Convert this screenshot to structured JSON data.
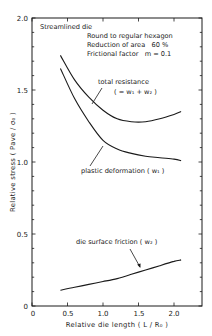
{
  "chart_data": {
    "type": "line",
    "title": "",
    "xlabel": "Relative die length ( L / R₀ )",
    "ylabel": "Relative stress  ( Pave / σ₀ )",
    "xlim": [
      0,
      2.4
    ],
    "ylim": [
      0,
      2.0
    ],
    "x_ticks": [
      "0",
      "0.5",
      "1.0",
      "1.5",
      "2.0"
    ],
    "y_ticks": [
      "0",
      "0.5",
      "1.0",
      "1.5",
      "2.0"
    ],
    "grid": false,
    "legend": "none (curves annotated directly)",
    "conditions": [
      "Streamlined die",
      "Round to regular hexagon",
      "Reduction of area   60 %",
      "Frictional factor   m = 0.1"
    ],
    "series": [
      {
        "name": "total resistance ( = w₁ + w₂ )",
        "x": [
          0.4,
          0.6,
          0.8,
          1.0,
          1.2,
          1.4,
          1.6,
          1.8,
          2.0,
          2.1
        ],
        "values": [
          1.74,
          1.57,
          1.45,
          1.36,
          1.3,
          1.28,
          1.28,
          1.3,
          1.33,
          1.35
        ]
      },
      {
        "name": "plastic deformation ( w₁ )",
        "x": [
          0.4,
          0.6,
          0.8,
          1.0,
          1.2,
          1.4,
          1.6,
          1.8,
          2.0,
          2.1
        ],
        "values": [
          1.65,
          1.44,
          1.28,
          1.15,
          1.09,
          1.06,
          1.04,
          1.03,
          1.02,
          1.01
        ]
      },
      {
        "name": "die surface friction ( w₂ )",
        "x": [
          0.4,
          0.6,
          0.8,
          1.0,
          1.2,
          1.4,
          1.6,
          1.8,
          2.0,
          2.1
        ],
        "values": [
          0.11,
          0.13,
          0.15,
          0.17,
          0.19,
          0.22,
          0.25,
          0.28,
          0.31,
          0.32
        ]
      }
    ],
    "annotations": {
      "total_1": "total resistance",
      "total_2": "( = w₁ + w₂ )",
      "plastic": "plastic deformation ( w₁ )",
      "friction": "die surface friction ( w₂ )"
    }
  }
}
